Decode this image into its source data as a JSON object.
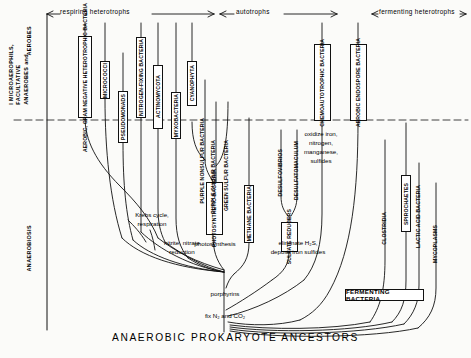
{
  "figure": {
    "bottom_title": "ANAEROBIC  PROKARYOTE  ANCESTORS",
    "axis": {
      "aerobes": "AEROBES",
      "microaerophils": "I MICROAEROPHILS,\nFACULTATIVE\nANAEROBES and",
      "anaerobiosis": "ANAEROBIOSIS"
    },
    "eras": [
      {
        "label": "respiring  heterotrophs"
      },
      {
        "label": "autotrophs"
      },
      {
        "label": "fermenting  heterotrophs"
      }
    ],
    "taxa": [
      {
        "id": "aerobic-gram-negative-heterotrophic-bacteria",
        "label": "AEROBIC, GRAM NEGATIVE\nHETEROTROPHIC BACTERIA"
      },
      {
        "id": "micrococci",
        "label": "MICROCOCCI"
      },
      {
        "id": "pseudomonads",
        "label": "PSEUDOMONADS"
      },
      {
        "id": "nitrogen-fixing-bacteria",
        "label": "NITROGEN-FIXING BACTERIA"
      },
      {
        "id": "actinomycota",
        "label": "ACTINOMYCOTA"
      },
      {
        "id": "myxobacteria",
        "label": "MYXOBACTERIA"
      },
      {
        "id": "cyanophyta",
        "label": "CYANOPHYTA"
      },
      {
        "id": "purple-nonsulfur-bacteria",
        "label": "PURPLE NONSULFUR\nBACTERIA"
      },
      {
        "id": "purple-sulfur-bacteria",
        "label": "PURPLE SULFUR\nBACTERIA"
      },
      {
        "id": "green-sulfur-bacteria",
        "label": "GREEN SULFUR\nBACTERIA"
      },
      {
        "id": "photosynthetic-bacteria",
        "label": "PHOTOSYNTHETIC\nBACTERIA"
      },
      {
        "id": "methane-bacteria",
        "label": "METHANE BACTERIA"
      },
      {
        "id": "desulfovibrios",
        "label": "DESULFOVIBRIOS"
      },
      {
        "id": "desulfatomaculum",
        "label": "DESULFATOMACULUM"
      },
      {
        "id": "sulfate-reducers",
        "label": "SULFATE\nREDUCERS"
      },
      {
        "id": "chemoautotrophic-bacteria",
        "label": "CHEMOAUTOTROPHIC\nBACTERIA"
      },
      {
        "id": "aerobic-endospore-bacteria",
        "label": "AEROBIC  ENDOSPORE\nBACTERIA"
      },
      {
        "id": "clostridia",
        "label": "CLOSTRIDIA"
      },
      {
        "id": "spirochaetes",
        "label": "SPIROCHAETES"
      },
      {
        "id": "lactic-acid-bacteria",
        "label": "LACTIC ACID BACTERIA"
      },
      {
        "id": "mycoplasms",
        "label": "MYCOPLASMS"
      },
      {
        "id": "fermenting-bacteria",
        "label": "FERMENTING BACTERIA"
      }
    ],
    "notes": [
      {
        "id": "krebs",
        "label": "Krebs cycle,\nrespiration"
      },
      {
        "id": "nitrite",
        "label": "nitrite, nitrate\nreduction"
      },
      {
        "id": "photosynthesis",
        "label": "photosynthesis"
      },
      {
        "id": "sulfide",
        "label": "eliminate H₂S,\ndeposit iron sulfides"
      },
      {
        "id": "oxidize",
        "label": "oxidize iron,\nnitrogen,\nmanganese,\nsulfides"
      },
      {
        "id": "porphyrins",
        "label": "porphyrins"
      },
      {
        "id": "fix",
        "label": "fix N₂ and CO₂"
      }
    ],
    "colors": {
      "ink": "#111111",
      "paper": "#fbfbf9"
    }
  }
}
